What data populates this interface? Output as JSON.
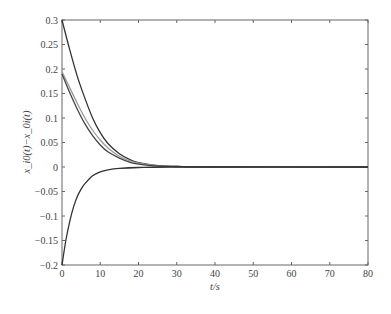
{
  "chart_data": {
    "type": "line",
    "title": "",
    "xlabel": "t/s",
    "ylabel": "x_i0(t)−x_0i(t)",
    "xlim": [
      0,
      80
    ],
    "ylim": [
      -0.2,
      0.3
    ],
    "xticks": [
      0,
      10,
      20,
      30,
      40,
      50,
      60,
      70,
      80
    ],
    "yticks": [
      -0.2,
      -0.15,
      -0.1,
      -0.05,
      0,
      0.05,
      0.1,
      0.15,
      0.2,
      0.25,
      0.3
    ],
    "ytick_labels": [
      "−0.2",
      "−0.15",
      "−0.1",
      "−0.05",
      "0",
      "0.05",
      "0.1",
      "0.15",
      "0.2",
      "0.25",
      "0.3"
    ],
    "xtick_labels": [
      "0",
      "10",
      "20",
      "30",
      "40",
      "50",
      "60",
      "70",
      "80"
    ],
    "grid": false,
    "legend": null,
    "series": [
      {
        "name": "error 1",
        "color": "#333333",
        "x": [
          0,
          2,
          4,
          6,
          8,
          10,
          12,
          15,
          18,
          20,
          25,
          30,
          40,
          80
        ],
        "y": [
          0.3,
          0.24,
          0.185,
          0.14,
          0.1,
          0.07,
          0.048,
          0.027,
          0.014,
          0.009,
          0.003,
          0.001,
          0.0,
          0.0
        ]
      },
      {
        "name": "error 2",
        "color": "#9a9a9a",
        "x": [
          0,
          2,
          4,
          6,
          8,
          10,
          12,
          15,
          18,
          20,
          25,
          30,
          40,
          80
        ],
        "y": [
          0.195,
          0.162,
          0.13,
          0.1,
          0.075,
          0.055,
          0.039,
          0.022,
          0.012,
          0.008,
          0.003,
          0.001,
          0.0,
          0.0
        ]
      },
      {
        "name": "error 3",
        "color": "#444444",
        "x": [
          0,
          2,
          4,
          6,
          8,
          10,
          12,
          15,
          18,
          20,
          25,
          30,
          40,
          80
        ],
        "y": [
          0.19,
          0.152,
          0.118,
          0.088,
          0.064,
          0.045,
          0.031,
          0.018,
          0.009,
          0.006,
          0.002,
          0.001,
          0.0,
          0.0
        ]
      },
      {
        "name": "error 4",
        "color": "#333333",
        "x": [
          0,
          1,
          2,
          3,
          4,
          5,
          6,
          8,
          10,
          12,
          15,
          20,
          30,
          80
        ],
        "y": [
          -0.2,
          -0.15,
          -0.112,
          -0.082,
          -0.06,
          -0.045,
          -0.034,
          -0.018,
          -0.01,
          -0.006,
          -0.003,
          -0.001,
          0.0,
          0.0
        ]
      }
    ]
  }
}
